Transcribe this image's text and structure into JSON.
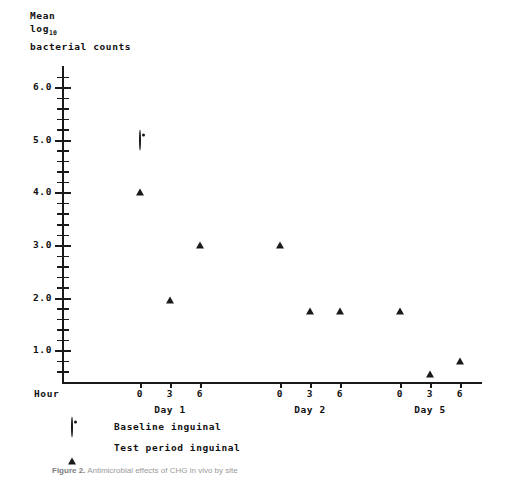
{
  "axis_title": {
    "line1": "Mean",
    "line2_base": "log",
    "line2_sub": "10",
    "line3": "bacterial counts"
  },
  "hour_axis_label": "Hour",
  "y_labels": [
    "6.0",
    "5.0",
    "4.0",
    "3.0",
    "2.0",
    "1.0"
  ],
  "x_tick_labels": [
    "0",
    "3",
    "6",
    "0",
    "3",
    "6",
    "0",
    "3",
    "6"
  ],
  "day_labels": [
    "Day 1",
    "Day 2",
    "Day 5"
  ],
  "legend": [
    {
      "marker": "circle-marker",
      "label": "Baseline inguinal"
    },
    {
      "marker": "triangle-marker",
      "label": "Test period inguinal"
    }
  ],
  "caption": {
    "figure_number": "Figure 2.",
    "text": "Antimicrobial effects of CHG in vivo by site"
  },
  "colors": {
    "ink": "#1a1a1a",
    "background": "#ffffff",
    "caption": "#9a9a9a"
  },
  "chart_data": {
    "type": "scatter",
    "title": "",
    "xlabel": "Hour",
    "ylabel": "Mean log10 bacterial counts",
    "ylim": [
      0.4,
      6.4
    ],
    "yticks": [
      1.0,
      2.0,
      3.0,
      4.0,
      5.0,
      6.0
    ],
    "minor_ticks": true,
    "grid": false,
    "legend_position": "below-axis",
    "x": [
      "Day 1 Hour 0",
      "Day 1 Hour 3",
      "Day 1 Hour 6",
      "Day 2 Hour 0",
      "Day 2 Hour 3",
      "Day 2 Hour 6",
      "Day 5 Hour 0",
      "Day 5 Hour 3",
      "Day 5 Hour 6"
    ],
    "series": [
      {
        "name": "Baseline inguinal",
        "marker": "circle",
        "points": [
          {
            "x": "Day 1 Hour 0",
            "y": 5.0
          }
        ]
      },
      {
        "name": "Test period inguinal",
        "marker": "triangle",
        "points": [
          {
            "x": "Day 1 Hour 0",
            "y": 4.25
          },
          {
            "x": "Day 1 Hour 3",
            "y": 2.2
          },
          {
            "x": "Day 1 Hour 6",
            "y": 3.25
          },
          {
            "x": "Day 2 Hour 0",
            "y": 3.25
          },
          {
            "x": "Day 2 Hour 3",
            "y": 2.0
          },
          {
            "x": "Day 2 Hour 6",
            "y": 2.0
          },
          {
            "x": "Day 5 Hour 0",
            "y": 2.0
          },
          {
            "x": "Day 5 Hour 3",
            "y": 0.8
          },
          {
            "x": "Day 5 Hour 6",
            "y": 1.05
          }
        ]
      }
    ]
  }
}
